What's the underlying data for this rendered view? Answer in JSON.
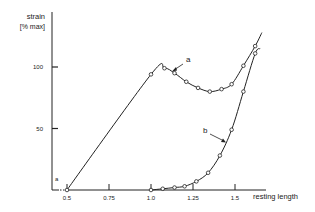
{
  "chart_data": {
    "type": "line",
    "title": "",
    "xlabel": "resting length",
    "ylabel": "strain",
    "ylabel_unit": "[% max]",
    "x_ticks": [
      0.5,
      0.75,
      1.0,
      1.25,
      1.5
    ],
    "x_tick_labels": [
      "0.5",
      "0.75",
      "1.0",
      "1.25",
      "1.5"
    ],
    "y_ticks": [
      50,
      100
    ],
    "y_tick_labels": [
      "50",
      "100"
    ],
    "xlim": [
      0.4,
      1.75
    ],
    "ylim": [
      0,
      140
    ],
    "grid": false,
    "legend": "none",
    "annotations": [
      {
        "text": "a",
        "x": 1.25,
        "y": 105,
        "points_to_series": "a"
      },
      {
        "text": "b",
        "x": 1.32,
        "y": 48,
        "points_to_series": "b"
      },
      {
        "text": "a",
        "x": 0.44,
        "y": 9
      }
    ],
    "series": [
      {
        "name": "a",
        "markers": "open-circle",
        "x": [
          0.5,
          1.0,
          1.08,
          1.14,
          1.21,
          1.28,
          1.35,
          1.42,
          1.48,
          1.55,
          1.62,
          1.66
        ],
        "y": [
          0,
          94,
          99,
          95,
          88,
          83,
          80,
          82,
          86,
          101,
          117,
          128
        ]
      },
      {
        "name": "b",
        "markers": "open-circle",
        "x": [
          1.0,
          1.07,
          1.14,
          1.2,
          1.27,
          1.34,
          1.41,
          1.48,
          1.55,
          1.62,
          1.65
        ],
        "y": [
          0,
          1,
          2,
          3,
          7,
          14,
          28,
          49,
          80,
          111,
          115
        ]
      }
    ]
  }
}
